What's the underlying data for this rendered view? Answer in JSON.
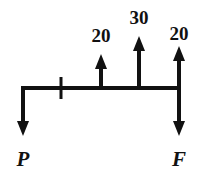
{
  "diagram": {
    "kind": "free-body-diagram",
    "background_color": "#ffffff",
    "ink_color": "#111111",
    "canvas": {
      "width": 202,
      "height": 176
    },
    "beam": {
      "name": "horizontal-beam",
      "y": 88,
      "x_start": 22,
      "x_end": 179,
      "thickness": 4
    },
    "tick": {
      "name": "section-tick-mark",
      "x": 61,
      "y_top": 77,
      "y_bottom": 99,
      "thickness": 3
    },
    "loads": [
      {
        "id": "load-20-left",
        "label": "20",
        "direction": "up",
        "x": 101,
        "tip_y": 54,
        "base_y": 88,
        "label_x": 101,
        "label_y": 42,
        "shaft_thickness": 4
      },
      {
        "id": "load-30-middle",
        "label": "30",
        "direction": "up",
        "x": 139,
        "tip_y": 36,
        "base_y": 88,
        "label_x": 139,
        "label_y": 24,
        "shaft_thickness": 4
      },
      {
        "id": "load-20-right",
        "label": "20",
        "direction": "up",
        "x": 179,
        "tip_y": 46,
        "base_y": 88,
        "label_x": 179,
        "label_y": 40,
        "shaft_thickness": 4
      }
    ],
    "reactions": [
      {
        "id": "reaction-P-left",
        "label": "P",
        "direction": "down",
        "x": 23,
        "top_y": 86,
        "tip_y": 136,
        "label_x": 23,
        "label_y": 166,
        "shaft_thickness": 4
      },
      {
        "id": "reaction-F-right",
        "label": "F",
        "direction": "down",
        "x": 179,
        "top_y": 88,
        "tip_y": 136,
        "label_x": 179,
        "label_y": 166,
        "shaft_thickness": 4
      }
    ],
    "arrow_head": {
      "half_width": 6,
      "length": 15
    }
  }
}
